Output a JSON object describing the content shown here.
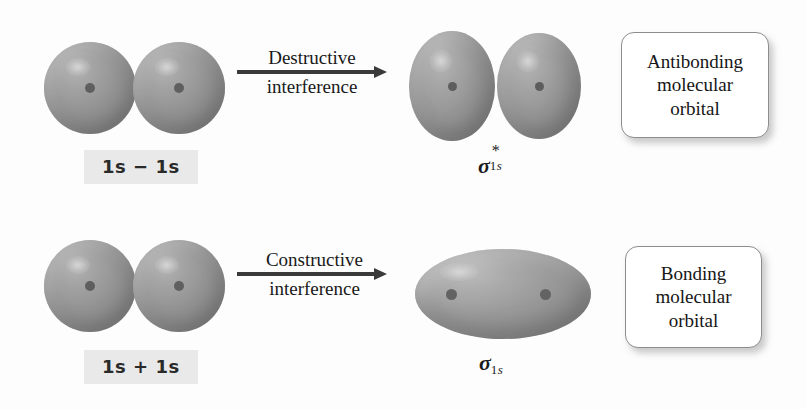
{
  "diagram": {
    "background_color": "#fdfdfd",
    "orbital_color": "#969696",
    "nucleus_color": "#5f5f5f",
    "arrow_color": "#3a3a3a",
    "highlight_band_color": "#e9e9e9",
    "callout_border_color": "#8d8d8d"
  },
  "rows": [
    {
      "id": "antibonding-row",
      "reactant_caption": {
        "full": "1s − 1s",
        "left_term": "1s",
        "operator": "−",
        "right_term": "1s"
      },
      "arrow": {
        "label_line1": "Destructive",
        "label_line2": "interference"
      },
      "product_label": {
        "full": "σ*₁ₛ",
        "symbol": "σ",
        "superscript": "*",
        "subscript": "1s"
      },
      "callout": {
        "line1": "Antibonding",
        "line2": "molecular",
        "line3": "orbital"
      }
    },
    {
      "id": "bonding-row",
      "reactant_caption": {
        "full": "1s + 1s",
        "left_term": "1s",
        "operator": "+",
        "right_term": "1s"
      },
      "arrow": {
        "label_line1": "Constructive",
        "label_line2": "interference"
      },
      "product_label": {
        "full": "σ₁ₛ",
        "symbol": "σ",
        "superscript": "",
        "subscript": "1s"
      },
      "callout": {
        "line1": "Bonding",
        "line2": "molecular",
        "line3": "orbital"
      }
    }
  ]
}
